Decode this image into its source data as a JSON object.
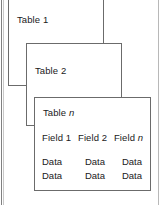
{
  "diagram": {
    "type": "nested-table-stack",
    "line_color": "#6b6b6b",
    "text_color": "#1a1a1a",
    "background": "#ffffff",
    "cards": [
      {
        "id": "table-1",
        "title_prefix": "Table",
        "title_suffix": "1",
        "title_suffix_italic": false,
        "label": "Table 1"
      },
      {
        "id": "table-2",
        "title_prefix": "Table",
        "title_suffix": "2",
        "title_suffix_italic": false,
        "label": "Table 2"
      },
      {
        "id": "table-n",
        "title_prefix": "Table",
        "title_suffix": "n",
        "title_suffix_italic": true,
        "label": "Table n",
        "fields": [
          {
            "label": "Field 1",
            "name_prefix": "Field",
            "name_suffix": "1",
            "italic_suffix": false
          },
          {
            "label": "Field 2",
            "name_prefix": "Field",
            "name_suffix": "2",
            "italic_suffix": false
          },
          {
            "label": "Field n",
            "name_prefix": "Field",
            "name_suffix": "n",
            "italic_suffix": true
          }
        ],
        "rows": [
          [
            "Data",
            "Data",
            "Data"
          ],
          [
            "Data",
            "Data",
            "Data"
          ]
        ]
      }
    ]
  }
}
